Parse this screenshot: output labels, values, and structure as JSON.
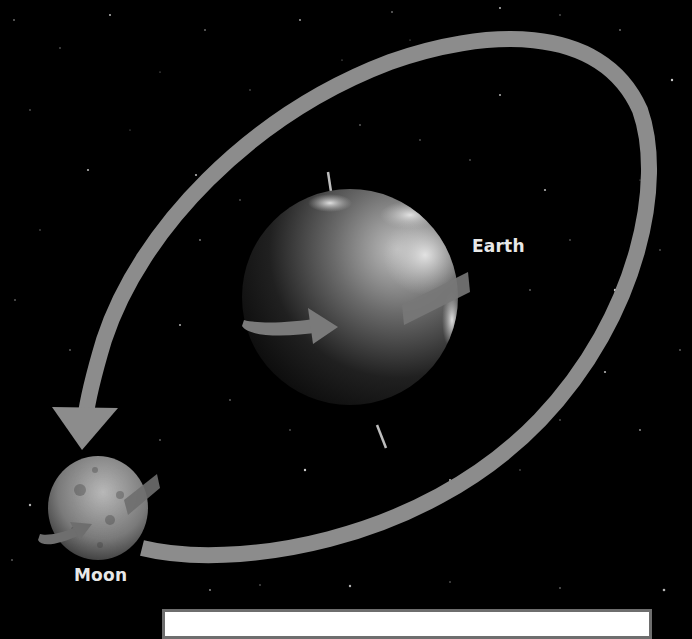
{
  "diagram": {
    "labels": {
      "earth": "Earth",
      "moon": "Moon"
    },
    "elements": [
      {
        "name": "earth",
        "shape": "sphere",
        "feature": "rotation-arrow",
        "axis": "tilted"
      },
      {
        "name": "moon",
        "shape": "sphere",
        "feature": "rotation-arrow"
      },
      {
        "name": "moon-orbit",
        "shape": "elliptical-arrow",
        "direction": "counterclockwise-toward-moon"
      }
    ],
    "caption_box": {
      "text": ""
    },
    "colors": {
      "background": "#000000",
      "orbit_arrow": "#8c8c8c",
      "label_text": "#e8e8e8",
      "caption_border": "#6e6e6e",
      "caption_fill": "#ffffff"
    }
  }
}
